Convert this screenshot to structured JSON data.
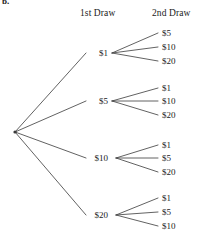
{
  "item_label": "b.",
  "headers": {
    "first": "1st Draw",
    "second": "2nd Draw"
  },
  "colors": {
    "line": "#3a3a3a",
    "text": "#1a1a1a",
    "background": "#ffffff"
  },
  "diagram": {
    "type": "probability-tree",
    "stages": 2,
    "root": {
      "x": 15,
      "y": 132
    },
    "branches": [
      {
        "label": "$1",
        "x": 108,
        "y": 53,
        "vertex_x": 112,
        "leaves": [
          {
            "label": "$5",
            "x": 162,
            "y": 33
          },
          {
            "label": "$10",
            "x": 162,
            "y": 47
          },
          {
            "label": "$20",
            "x": 162,
            "y": 61
          }
        ]
      },
      {
        "label": "$5",
        "x": 108,
        "y": 101,
        "vertex_x": 112,
        "leaves": [
          {
            "label": "$1",
            "x": 162,
            "y": 88
          },
          {
            "label": "$10",
            "x": 162,
            "y": 101
          },
          {
            "label": "$20",
            "x": 162,
            "y": 115
          }
        ]
      },
      {
        "label": "$10",
        "x": 108,
        "y": 158,
        "vertex_x": 116,
        "leaves": [
          {
            "label": "$1",
            "x": 162,
            "y": 145
          },
          {
            "label": "$5",
            "x": 162,
            "y": 158
          },
          {
            "label": "$20",
            "x": 162,
            "y": 172
          }
        ]
      },
      {
        "label": "$20",
        "x": 108,
        "y": 215,
        "vertex_x": 116,
        "leaves": [
          {
            "label": "$1",
            "x": 162,
            "y": 198
          },
          {
            "label": "$5",
            "x": 162,
            "y": 212
          },
          {
            "label": "$10",
            "x": 162,
            "y": 226
          }
        ]
      }
    ]
  }
}
